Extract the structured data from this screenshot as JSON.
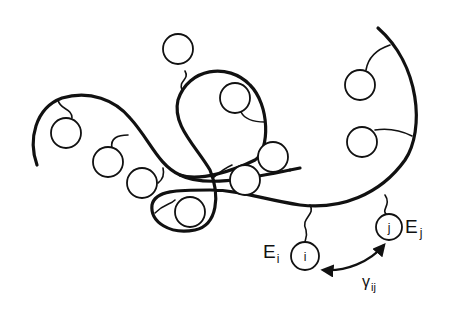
{
  "diagram": {
    "type": "polymer-chain-schematic",
    "labels": {
      "energy_i": "E",
      "energy_i_sub": "i",
      "energy_j": "E",
      "energy_j_sub": "j",
      "bead_i": "i",
      "bead_j": "j",
      "interaction": "γ",
      "interaction_sub": "ij"
    },
    "bead_count": 12,
    "colors": {
      "stroke": "#111111",
      "background": "#ffffff"
    }
  }
}
